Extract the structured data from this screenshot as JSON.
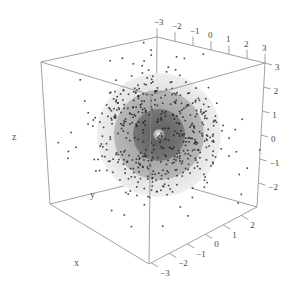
{
  "chart_data": {
    "type": "scatter",
    "subtype": "3d-scatter-with-nested-spheres",
    "title": "",
    "axes": {
      "x": {
        "label": "x",
        "ticks": [
          -3,
          -2,
          -1,
          0,
          1,
          2
        ],
        "range": [
          -3,
          3
        ]
      },
      "y": {
        "label": "y",
        "ticks": [
          -3,
          -2,
          -1,
          0,
          1,
          2,
          3
        ],
        "range": [
          -3,
          3
        ]
      },
      "z": {
        "label": "z",
        "ticks": [
          -2,
          -1,
          0,
          1,
          2,
          3
        ],
        "range": [
          -3,
          3
        ]
      }
    },
    "spheres": [
      {
        "name": "outer",
        "radius": 3,
        "color": "#e6e6e6",
        "opacity": 0.9
      },
      {
        "name": "middle",
        "radius": 2,
        "color": "#a9a9a9",
        "opacity": 0.85
      },
      {
        "name": "inner",
        "radius": 1.2,
        "color": "#6f6f6f",
        "opacity": 0.9
      },
      {
        "name": "core",
        "radius": 0.3,
        "color": "#bdbdbd",
        "opacity": 1
      }
    ],
    "points": {
      "count_approx": 500,
      "distribution": "concentrated near shell radius ~2, sparse outside",
      "color": "#222222"
    },
    "grid": false,
    "legend": null
  },
  "labels": {
    "x_title": "x",
    "y_title": "y",
    "z_title": "z",
    "top_ticks": [
      "−3",
      "−2",
      "−1",
      "0",
      "1",
      "2",
      "3"
    ],
    "right_top_tick": "3",
    "z_ticks": [
      "3",
      "2",
      "1",
      "0",
      "−1",
      "−2"
    ],
    "bottom_ticks": [
      "−3",
      "−2",
      "−1",
      "0",
      "1",
      "2"
    ]
  }
}
